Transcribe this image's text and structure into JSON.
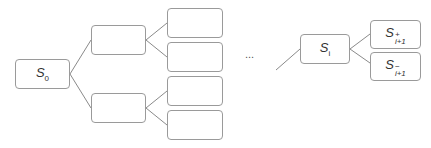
{
  "diagram": {
    "type": "tree",
    "colors": {
      "border": "#9a9a9a",
      "edge": "#8a8a8a",
      "text": "#333333"
    },
    "nodes": {
      "root": {
        "base": "S",
        "sub": "0"
      },
      "si": {
        "base": "S",
        "sub": "i"
      },
      "si1_plus": {
        "base": "S",
        "sup": "+",
        "sub": "i+1"
      },
      "si1_minus": {
        "base": "S",
        "sup": "−",
        "sub": "i+1"
      }
    },
    "ellipsis": "..."
  }
}
